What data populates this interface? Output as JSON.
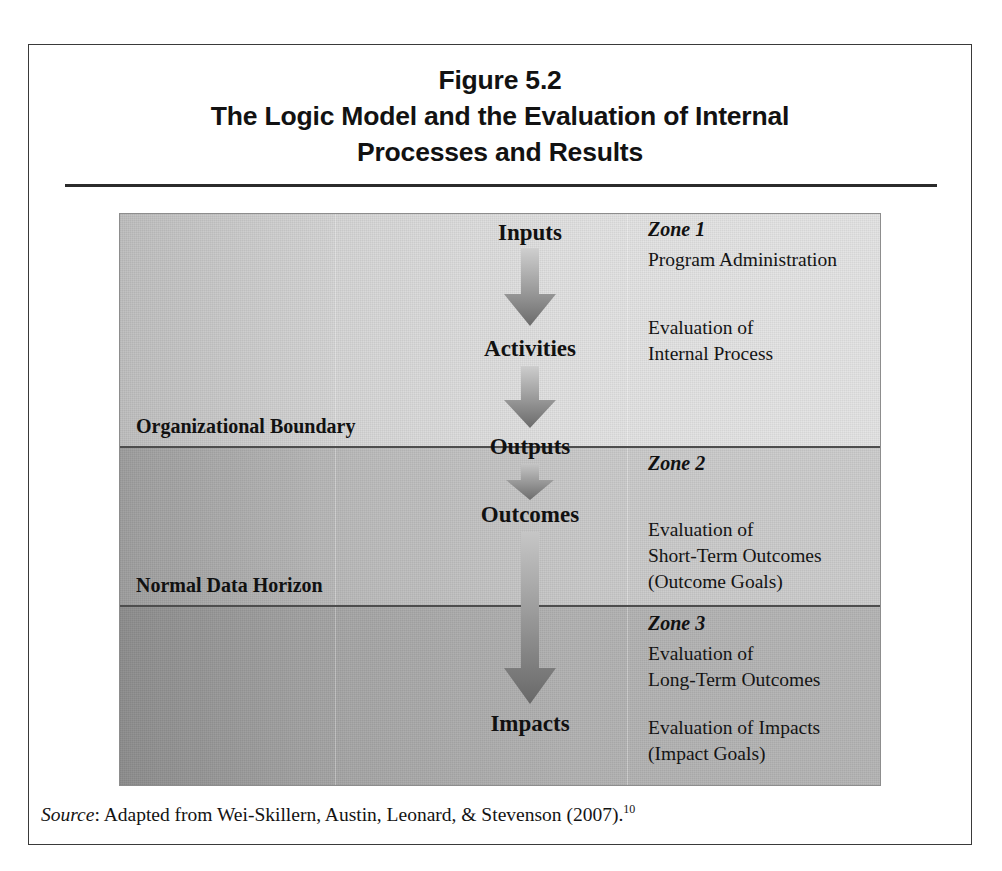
{
  "figure": {
    "title_lines": [
      "Figure 5.2",
      "The Logic Model and the Evaluation of Internal",
      "Processes and Results"
    ],
    "source": {
      "label": "Source",
      "separator": ":",
      "text": " Adapted from Wei-Skillern, Austin, Leonard, & Stevenson (2007).",
      "footnote": "10"
    }
  },
  "diagram": {
    "flow_steps": [
      {
        "label": "Inputs"
      },
      {
        "label": "Activities"
      },
      {
        "label": "Outputs"
      },
      {
        "label": "Outcomes"
      },
      {
        "label": "Impacts"
      }
    ],
    "arrows": [
      {
        "name": "inputs-to-activities"
      },
      {
        "name": "activities-to-outputs"
      },
      {
        "name": "outputs-to-outcomes"
      },
      {
        "name": "outcomes-to-impacts"
      }
    ],
    "boundaries": [
      {
        "label": "Organizational Boundary"
      },
      {
        "label": "Normal Data Horizon"
      }
    ],
    "zones": [
      {
        "heading": "Zone 1",
        "lines": [
          "Program Administration"
        ],
        "lines_secondary": [
          "Evaluation of",
          "Internal Process"
        ]
      },
      {
        "heading": "Zone 2",
        "lines": [],
        "lines_secondary": [
          "Evaluation of",
          "Short-Term Outcomes",
          "(Outcome Goals)"
        ]
      },
      {
        "heading": "Zone 3",
        "lines": [
          "Evaluation of",
          "Long-Term Outcomes"
        ],
        "lines_secondary": [
          "Evaluation of Impacts",
          "(Impact Goals)"
        ]
      }
    ]
  },
  "colors": {
    "frame_border": "#3a3a3a",
    "title_rule": "#2b2b2b",
    "panel_base": "#d9d9d9",
    "divider": "#4d4d4d",
    "arrow_light": "#c9c9c9",
    "arrow_dark": "#707070",
    "text": "#141414"
  }
}
